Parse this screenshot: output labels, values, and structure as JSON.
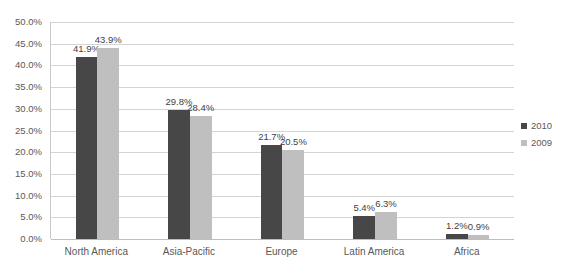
{
  "chart_data": {
    "type": "bar",
    "title": "",
    "subtitle": "",
    "xlabel": "",
    "ylabel": "",
    "ylim": [
      0,
      50
    ],
    "ytick_values": [
      0,
      5,
      10,
      15,
      20,
      25,
      30,
      35,
      40,
      45,
      50
    ],
    "ytick_labels": [
      "0.0%",
      "5.0%",
      "10.0%",
      "15.0%",
      "20.0%",
      "25.0%",
      "30.0%",
      "35.0%",
      "40.0%",
      "45.0%",
      "50.0%"
    ],
    "grid": true,
    "legend_position": "right",
    "value_labels": true,
    "categories": [
      "North America",
      "Asia-Pacific",
      "Europe",
      "Latin America",
      "Africa"
    ],
    "series": [
      {
        "name": "2010",
        "color": "#474747",
        "values": [
          41.9,
          29.8,
          21.7,
          5.4,
          1.2
        ],
        "labels": [
          "41.9%",
          "29.8%",
          "21.7%",
          "5.4%",
          "1.2%"
        ]
      },
      {
        "name": "2009",
        "color": "#bfbfbf",
        "values": [
          43.9,
          28.4,
          20.5,
          6.3,
          0.9
        ],
        "labels": [
          "43.9%",
          "28.4%",
          "20.5%",
          "6.3%",
          "0.9%"
        ]
      }
    ]
  },
  "legend": {
    "items": [
      {
        "label": "2010",
        "color": "#474747"
      },
      {
        "label": "2009",
        "color": "#bfbfbf"
      }
    ]
  },
  "colors": {
    "background": "#ffffff",
    "gridline": "#d4d4d4",
    "axis": "#bdbdbd",
    "text": "#595959",
    "series_2010": "#474747",
    "series_2009": "#bfbfbf"
  }
}
